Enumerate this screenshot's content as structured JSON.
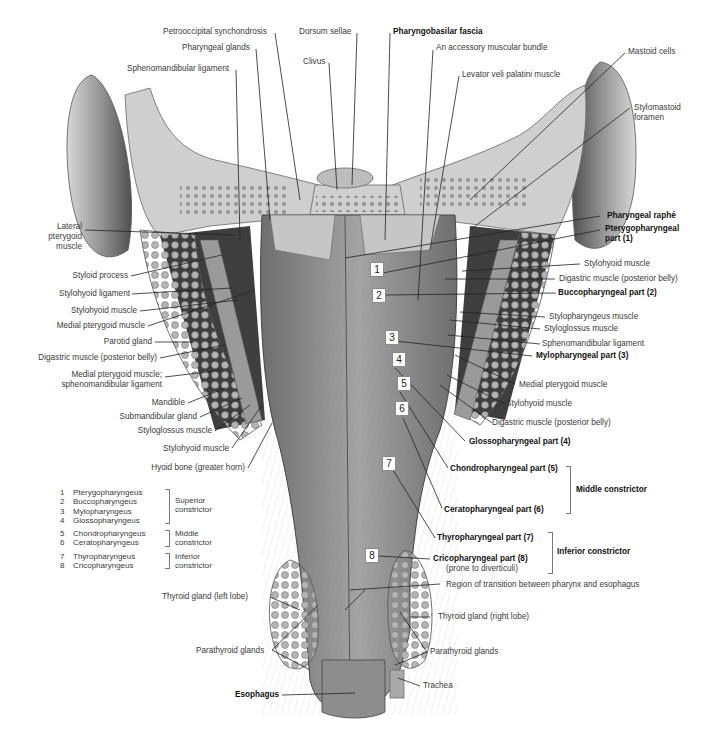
{
  "figure": {
    "top_labels": [
      {
        "id": "petrooccipital",
        "text": "Petrooccipital synchondrosis",
        "bold": false
      },
      {
        "id": "dorsum",
        "text": "Dorsum sellae",
        "bold": false
      },
      {
        "id": "pharyngobasilar",
        "text": "Pharyngobasilar fascia",
        "bold": true
      },
      {
        "id": "pharyngeal-glands",
        "text": "Pharyngeal glands",
        "bold": false
      },
      {
        "id": "accessory",
        "text": "An accessory muscular bundle",
        "bold": false
      },
      {
        "id": "clivus",
        "text": "Clivus",
        "bold": false
      },
      {
        "id": "sphenomandibular-top",
        "text": "Sphenomandibular ligament",
        "bold": false
      },
      {
        "id": "levator",
        "text": "Levator veli palatini muscle",
        "bold": false
      },
      {
        "id": "mastoid",
        "text": "Mastoid cells",
        "bold": false
      },
      {
        "id": "stylomastoid",
        "text": "Stylomastoid foramen",
        "bold": false
      }
    ],
    "left_labels": [
      {
        "id": "lateral-pterygoid",
        "text": "Lateral pterygoid muscle"
      },
      {
        "id": "styloid-process",
        "text": "Styloid process"
      },
      {
        "id": "stylohyoid-ligament",
        "text": "Stylohyoid ligament"
      },
      {
        "id": "stylohyoid-muscle-l",
        "text": "Stylohyoid muscle"
      },
      {
        "id": "medial-pterygoid-l",
        "text": "Medial pterygoid muscle"
      },
      {
        "id": "parotid",
        "text": "Parotid gland"
      },
      {
        "id": "digastric-l",
        "text": "Digastric muscle (posterior belly)"
      },
      {
        "id": "medial-ptery-spheno",
        "text": "Medial pterygoid muscle;"
      },
      {
        "id": "medial-ptery-spheno-2",
        "text": "sphenomandibular ligament"
      },
      {
        "id": "mandible",
        "text": "Mandible"
      },
      {
        "id": "submandibular",
        "text": "Submandibular gland"
      },
      {
        "id": "styloglossus-l",
        "text": "Styloglossus muscle"
      },
      {
        "id": "stylohyoid-muscle-l2",
        "text": "Stylohyoid muscle"
      },
      {
        "id": "hyoid",
        "text": "Hyoid bone (greater horn)"
      }
    ],
    "right_labels": [
      {
        "id": "raphe",
        "text": "Pharyngeal raphé",
        "bold": true
      },
      {
        "id": "pterygopharyngeal",
        "text": "Pterygopharyngeal",
        "bold": true
      },
      {
        "id": "pterygopharyngeal-2",
        "text": "part (1)",
        "bold": true
      },
      {
        "id": "stylohyoid-r",
        "text": "Stylohyoid muscle",
        "bold": false
      },
      {
        "id": "digastric-r",
        "text": "Digastric muscle (posterior belly)",
        "bold": false
      },
      {
        "id": "buccopharyngeal",
        "text": "Buccopharyngeal part (2)",
        "bold": true
      },
      {
        "id": "stylopharyngeus",
        "text": "Stylopharyngeus muscle",
        "bold": false
      },
      {
        "id": "styloglossus-r",
        "text": "Styloglossus muscle",
        "bold": false
      },
      {
        "id": "sphenomandibular-r",
        "text": "Sphenomandibular ligament",
        "bold": false
      },
      {
        "id": "mylopharyngeal",
        "text": "Mylopharyngeal part (3)",
        "bold": true
      },
      {
        "id": "medial-pterygoid-r",
        "text": "Medial pterygoid muscle",
        "bold": false
      },
      {
        "id": "stylohyoid-r2",
        "text": "Stylohyoid muscle",
        "bold": false
      },
      {
        "id": "digastric-r2",
        "text": "Digastric muscle (posterior belly)",
        "bold": false
      },
      {
        "id": "glossopharyngeal",
        "text": "Glossopharyngeal part (4)",
        "bold": true
      },
      {
        "id": "chondropharyngeal",
        "text": "Chondropharyngeal part (5)",
        "bold": true
      },
      {
        "id": "ceratopharyngeal",
        "text": "Ceratopharyngeal part (6)",
        "bold": true
      },
      {
        "id": "thyropharyngeal",
        "text": "Thyropharyngeal part (7)",
        "bold": true
      },
      {
        "id": "cricopharyngeal",
        "text": "Cricopharyngeal part (8)",
        "bold": true
      },
      {
        "id": "cricopharyngeal-note",
        "text": "(prone to diverticuli)",
        "bold": false
      },
      {
        "id": "transition",
        "text": "Region of transition between pharynx and esophagus",
        "bold": false
      },
      {
        "id": "thyroid-right",
        "text": "Thyroid gland (right lobe)",
        "bold": false
      },
      {
        "id": "parathyroid-r",
        "text": "Parathyroid glands",
        "bold": false
      },
      {
        "id": "trachea",
        "text": "Trachea",
        "bold": false
      }
    ],
    "bottom_left_labels": [
      {
        "id": "thyroid-left",
        "text": "Thyroid gland (left lobe)"
      },
      {
        "id": "parathyroid-l",
        "text": "Parathyroid glands"
      },
      {
        "id": "esophagus",
        "text": "Esophagus"
      }
    ],
    "groups": {
      "middle": "Middle constrictor",
      "inferior": "Inferior constrictor"
    },
    "number_markers": [
      "1",
      "2",
      "3",
      "4",
      "5",
      "6",
      "7",
      "8"
    ],
    "legend": [
      {
        "group": "Superior\nconstrictor",
        "group_l1": "Superior",
        "group_l2": "constrictor",
        "items": [
          {
            "n": "1",
            "name": "Pterygopharyngeus"
          },
          {
            "n": "2",
            "name": "Buccopharyngeus"
          },
          {
            "n": "3",
            "name": "Mylopharyngeus"
          },
          {
            "n": "4",
            "name": "Glossopharyngeus"
          }
        ]
      },
      {
        "group_l1": "Middle",
        "group_l2": "constrictor",
        "items": [
          {
            "n": "5",
            "name": "Chondropharyngeus"
          },
          {
            "n": "6",
            "name": "Ceratopharyngeus"
          }
        ]
      },
      {
        "group_l1": "Inferior",
        "group_l2": "constrictor",
        "items": [
          {
            "n": "7",
            "name": "Thyropharyngeus"
          },
          {
            "n": "8",
            "name": "Cricopharyngeus"
          }
        ]
      }
    ],
    "colors": {
      "muscle": "#8c8c8c",
      "muscle_dark": "#5e5e5e",
      "bone": "#c8c8c8",
      "gland": "#9a9a9a",
      "leader": "#222222"
    }
  }
}
